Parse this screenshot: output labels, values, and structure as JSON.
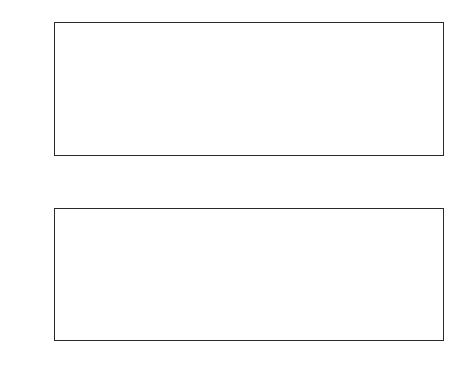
{
  "figure": {
    "background_color": "#ffffff",
    "line_color": "#3a3a3a",
    "axis_color": "#2b2b2b"
  },
  "chart_data": [
    {
      "type": "line",
      "id": "top-panel",
      "title": "",
      "xlabel": "",
      "ylabel": "r3",
      "xlim": [
        0,
        1.97
      ],
      "ylim": [
        -1,
        1
      ],
      "grid": false,
      "legend": null,
      "xticks": [
        0,
        0.2,
        0.4,
        0.6,
        0.8,
        1,
        1.2,
        1.4,
        1.6,
        1.8
      ],
      "xticklabels": [
        "0",
        "0.2",
        "0.4",
        "0.6",
        "0.8",
        "1",
        "1.2",
        "1.4",
        "1.6",
        "1.8"
      ],
      "yticks": [
        -0.5,
        0,
        0.5,
        1
      ],
      "yticklabels": [
        "-0.5",
        "0",
        "0.5",
        "1"
      ],
      "series": [
        {
          "name": "r3",
          "x": [
            0.0,
            0.01,
            0.02,
            0.03,
            0.04,
            0.05,
            0.06,
            0.07,
            0.08,
            0.09,
            0.1,
            0.11,
            0.12,
            0.13,
            0.14,
            0.15,
            0.16,
            0.17,
            0.18,
            0.19,
            0.195,
            0.2,
            0.205,
            0.21,
            0.215,
            0.22,
            0.225,
            0.23,
            0.24,
            0.25,
            0.26,
            0.27,
            0.28,
            0.29,
            0.3,
            0.31,
            0.32,
            0.33,
            0.34,
            0.35,
            0.36,
            0.37,
            0.38,
            0.385,
            0.39,
            0.393,
            0.396,
            0.4,
            0.405,
            0.41,
            0.415,
            0.42,
            0.425,
            0.43,
            0.44,
            0.45,
            0.46,
            0.47,
            0.48,
            0.49,
            0.5,
            0.51,
            0.52,
            0.54,
            0.56,
            0.57,
            0.58,
            0.585,
            0.59,
            0.595,
            0.6,
            0.603,
            0.606,
            0.609,
            0.612,
            0.615,
            0.618,
            0.622,
            0.626,
            0.63,
            0.633,
            0.636,
            0.64,
            0.645,
            0.65,
            0.655,
            0.66,
            0.665,
            0.67,
            0.675,
            0.68,
            0.69,
            0.7,
            0.71,
            0.72,
            0.73,
            0.74,
            0.75,
            0.76,
            0.77,
            0.78,
            0.79,
            0.8,
            0.81,
            0.815,
            0.82,
            0.825,
            0.83,
            0.84,
            0.845,
            0.85,
            0.855,
            0.858,
            0.861,
            0.864,
            0.867,
            0.87,
            0.875,
            0.88,
            0.885,
            0.89,
            0.895,
            0.9,
            0.91,
            0.92,
            0.93,
            0.94,
            0.95,
            0.96,
            0.97,
            0.98,
            0.99,
            1.0,
            1.01,
            1.02,
            1.03,
            1.04,
            1.05,
            1.06,
            1.065,
            1.07,
            1.075,
            1.08,
            1.085,
            1.09,
            1.095,
            1.1,
            1.105,
            1.108,
            1.111,
            1.114,
            1.117,
            1.12,
            1.125,
            1.13,
            1.135,
            1.14,
            1.145,
            1.15,
            1.155,
            1.16,
            1.17,
            1.18,
            1.19,
            1.2,
            1.205,
            1.21,
            1.215,
            1.22,
            1.225,
            1.23,
            1.24,
            1.25,
            1.255,
            1.26,
            1.27,
            1.28,
            1.29,
            1.3,
            1.31,
            1.32,
            1.33,
            1.34,
            1.345,
            1.35,
            1.355,
            1.36,
            1.365,
            1.37,
            1.375,
            1.38,
            1.385,
            1.39,
            1.393,
            1.396,
            1.399,
            1.402,
            1.405,
            1.41,
            1.415,
            1.42,
            1.425,
            1.43,
            1.435,
            1.44,
            1.445,
            1.45,
            1.46,
            1.47,
            1.48,
            1.49,
            1.5,
            1.51,
            1.52,
            1.53,
            1.54,
            1.55,
            1.56,
            1.57,
            1.58,
            1.59,
            1.6,
            1.61,
            1.62,
            1.63,
            1.64,
            1.645,
            1.65,
            1.655,
            1.658,
            1.661,
            1.664,
            1.667,
            1.67,
            1.675,
            1.68,
            1.685,
            1.69,
            1.695,
            1.7,
            1.71,
            1.72,
            1.73,
            1.74,
            1.75,
            1.76,
            1.77,
            1.78,
            1.79,
            1.8,
            1.81,
            1.82,
            1.83,
            1.84,
            1.85,
            1.86,
            1.87,
            1.88,
            1.885,
            1.89,
            1.895,
            1.9,
            1.905,
            1.91,
            1.915,
            1.92,
            1.925,
            1.93,
            1.94,
            1.95,
            1.96,
            1.965,
            1.97
          ],
          "y": [
            -0.15,
            -0.16,
            -0.158,
            -0.15,
            -0.135,
            -0.11,
            -0.075,
            -0.03,
            0.02,
            0.08,
            0.125,
            0.14,
            0.13,
            0.09,
            0.03,
            -0.05,
            -0.13,
            -0.19,
            -0.215,
            -0.12,
            0.2,
            0.61,
            0.42,
            0.0,
            -0.3,
            -0.48,
            -0.57,
            -0.59,
            -0.53,
            -0.44,
            -0.33,
            -0.21,
            -0.08,
            0.08,
            0.25,
            0.42,
            0.57,
            0.7,
            0.79,
            0.82,
            0.8,
            0.73,
            0.6,
            0.48,
            0.31,
            0.43,
            0.26,
            0.23,
            0.09,
            -0.08,
            -0.25,
            -0.39,
            -0.465,
            -0.48,
            -0.44,
            -0.36,
            -0.25,
            -0.11,
            0.06,
            0.25,
            0.45,
            0.64,
            0.8,
            0.96,
            1.0,
            1.0,
            0.995,
            0.985,
            0.99,
            1.0,
            1.0,
            0.7,
            0.3,
            0.28,
            0.7,
            0.99,
            1.0,
            0.985,
            0.77,
            0.42,
            0.27,
            0.6,
            0.98,
            0.96,
            0.85,
            0.68,
            0.44,
            0.16,
            -0.15,
            -0.42,
            -0.62,
            -0.87,
            -0.97,
            -0.995,
            -0.96,
            -0.84,
            -0.64,
            -0.38,
            -0.08,
            0.25,
            0.55,
            0.8,
            0.95,
            1.0,
            1.0,
            0.995,
            0.99,
            0.985,
            0.97,
            0.96,
            0.94,
            0.9,
            0.82,
            0.56,
            0.25,
            0.4,
            0.33,
            0.14,
            -0.1,
            -0.35,
            -0.58,
            -0.76,
            -0.89,
            -0.975,
            -0.99,
            -0.995,
            -0.995,
            -0.99,
            -0.97,
            -0.9,
            -0.77,
            -0.56,
            -0.3,
            -0.02,
            0.23,
            0.44,
            0.62,
            0.76,
            0.86,
            0.88,
            0.87,
            0.88,
            0.91,
            0.945,
            0.96,
            0.95,
            0.93,
            0.9,
            0.86,
            0.78,
            0.62,
            0.3,
            0.1,
            0.32,
            0.25,
            0.05,
            -0.2,
            -0.43,
            -0.62,
            -0.76,
            -0.87,
            -0.94,
            -0.98,
            -0.995,
            -1.0,
            -1.0,
            -0.985,
            -0.92,
            -0.7,
            -0.3,
            0.08,
            0.15,
            0.19,
            0.17,
            0.12,
            0.06,
            0.03,
            0.06,
            0.09,
            0.13,
            0.18,
            0.23,
            0.28,
            0.32,
            0.36,
            0.42,
            0.44,
            0.43,
            0.4,
            0.33,
            0.23,
            0.11,
            -0.02,
            -0.14,
            -0.23,
            -0.26,
            -0.07,
            0.1,
            -0.05,
            -0.2,
            -0.38,
            -0.56,
            -0.72,
            -0.84,
            -0.92,
            -0.965,
            -0.985,
            -0.995,
            -1.0,
            -0.995,
            -0.97,
            -0.9,
            -0.78,
            -0.61,
            -0.4,
            -0.17,
            0.07,
            0.28,
            0.44,
            0.54,
            0.59,
            0.6,
            0.58,
            0.52,
            0.43,
            0.31,
            0.17,
            0.02,
            -0.12,
            -0.2,
            0.06,
            0.12,
            -0.08,
            -0.18,
            -0.3,
            -0.46,
            -0.62,
            -0.76,
            -0.87,
            -0.94,
            -0.98,
            -0.995,
            -1.0,
            -1.0,
            -0.995,
            -0.96,
            -0.88,
            -0.74,
            -0.54,
            -0.29,
            -0.02,
            0.24,
            0.46,
            0.63,
            0.73,
            0.78,
            0.77,
            0.7,
            0.58,
            0.42,
            0.24,
            0.14,
            0.08,
            -0.05,
            -0.12,
            -0.06,
            -0.18,
            -0.32,
            -0.48,
            -0.64,
            -0.78,
            -0.9,
            -0.97,
            -0.995,
            -0.85
          ]
        }
      ]
    },
    {
      "type": "line",
      "id": "bottom-panel",
      "title": "",
      "xlabel": "Time in seconds",
      "ylabel": "Output of the matched filter",
      "xlim": [
        0,
        1.97
      ],
      "ylim": [
        -5.8,
        10.2
      ],
      "grid": false,
      "legend": null,
      "xticks": [
        0,
        0.2,
        0.4,
        0.6,
        0.8,
        1,
        1.2,
        1.4,
        1.6,
        1.8
      ],
      "xticklabels": [
        "0",
        "0.2",
        "0.4",
        "0.6",
        "0.8",
        "1",
        "1.2",
        "1.4",
        "1.6",
        "1.8"
      ],
      "yticks": [
        -5,
        0,
        5,
        10
      ],
      "yticklabels": [
        "-5",
        "0",
        "5",
        "10"
      ],
      "series": [
        {
          "name": "matched filter output",
          "x": [
            0.0,
            0.02,
            0.04,
            0.06,
            0.08,
            0.1,
            0.12,
            0.14,
            0.155,
            0.17,
            0.185,
            0.2,
            0.215,
            0.23,
            0.245,
            0.26,
            0.275,
            0.29,
            0.305,
            0.32,
            0.33,
            0.345,
            0.36,
            0.37,
            0.38,
            0.39,
            0.4,
            0.41,
            0.425,
            0.44,
            0.455,
            0.47,
            0.485,
            0.5,
            0.515,
            0.53,
            0.545,
            0.56,
            0.575,
            0.59,
            0.6,
            0.612,
            0.625,
            0.64,
            0.655,
            0.67,
            0.685,
            0.7,
            0.715,
            0.73,
            0.74,
            0.755,
            0.77,
            0.785,
            0.8,
            0.812,
            0.822,
            0.832,
            0.845,
            0.86,
            0.875,
            0.89,
            0.905,
            0.92,
            0.935,
            0.95,
            0.962,
            0.975,
            0.99,
            1.005,
            1.02,
            1.035,
            1.05,
            1.062,
            1.075,
            1.09,
            1.105,
            1.12,
            1.14,
            1.16,
            1.18,
            1.2,
            1.22,
            1.238,
            1.255,
            1.27,
            1.285,
            1.3,
            1.315,
            1.328,
            1.34,
            1.355,
            1.37,
            1.385,
            1.4,
            1.412,
            1.425,
            1.44,
            1.455,
            1.47,
            1.485,
            1.5,
            1.515,
            1.53,
            1.545,
            1.56,
            1.575,
            1.59,
            1.605,
            1.62,
            1.635,
            1.65,
            1.665,
            1.68,
            1.695,
            1.71,
            1.725,
            1.74,
            1.755,
            1.77,
            1.785,
            1.8,
            1.815,
            1.83,
            1.845,
            1.86,
            1.872,
            1.885,
            1.9,
            1.915,
            1.93,
            1.945,
            1.96,
            1.97
          ],
          "y": [
            -0.2,
            -0.25,
            -0.28,
            -0.27,
            -0.23,
            -0.15,
            -0.06,
            0.08,
            0.3,
            0.32,
            0.18,
            -0.05,
            -0.35,
            -0.7,
            -0.98,
            -0.9,
            -0.45,
            0.1,
            0.65,
            0.48,
            0.05,
            -0.5,
            -0.8,
            -0.2,
            1.4,
            3.6,
            5.6,
            6.0,
            5.0,
            3.0,
            0.6,
            -1.3,
            -2.2,
            -2.5,
            -2.2,
            -1.4,
            0.2,
            2.4,
            5.0,
            7.4,
            8.5,
            8.3,
            6.9,
            4.6,
            2.0,
            -0.3,
            -1.9,
            -2.7,
            -2.8,
            -2.2,
            -1.5,
            0.5,
            3.0,
            6.0,
            8.8,
            10.2,
            10.0,
            8.0,
            5.0,
            2.0,
            -0.8,
            -3.0,
            -4.5,
            -5.3,
            -5.5,
            -5.3,
            -5.1,
            -4.0,
            -2.0,
            0.5,
            3.2,
            5.8,
            7.6,
            8.2,
            7.6,
            6.0,
            4.0,
            2.0,
            -0.8,
            -3.0,
            -4.8,
            -5.7,
            -5.8,
            -5.2,
            -3.7,
            -1.8,
            0.5,
            2.8,
            4.1,
            4.4,
            3.3,
            1.7,
            0.9,
            1.1,
            1.3,
            1.1,
            0.3,
            -1.0,
            -2.5,
            -3.8,
            -4.9,
            -5.4,
            -5.3,
            -4.7,
            -3.5,
            -1.8,
            0.2,
            2.2,
            4.1,
            5.5,
            5.9,
            5.5,
            4.3,
            2.5,
            0.5,
            -1.5,
            -3.4,
            -4.8,
            -5.4,
            -5.5,
            -5.1,
            -4.0,
            -2.3,
            -0.2,
            2.0,
            4.0,
            5.6,
            6.3,
            6.1,
            5.2,
            3.7,
            1.8,
            -0.5,
            -2.8,
            -4.4,
            -5.0
          ]
        }
      ]
    }
  ]
}
